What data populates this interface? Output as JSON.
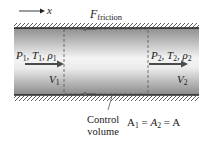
{
  "diagram": {
    "x_axis": {
      "label": "x"
    },
    "friction": {
      "symbol": "F",
      "subscript": "friction"
    },
    "inlet": {
      "P": "P",
      "P_sub": "1",
      "T": "T",
      "T_sub": "1",
      "rho": "ρ",
      "rho_sub": "1",
      "V": "V",
      "V_sub": "1",
      "sep": ", "
    },
    "outlet": {
      "P": "P",
      "P_sub": "2",
      "T": "T",
      "T_sub": "2",
      "rho": "ρ",
      "rho_sub": "2",
      "V": "V",
      "V_sub": "2",
      "sep": ", "
    },
    "control_volume": {
      "line1": "Control",
      "line2": "volume"
    },
    "area_relation": {
      "A1": "A",
      "A1_sub": "1",
      "eq1": " = ",
      "A2": "A",
      "A2_sub": "2",
      "eq2": " = ",
      "A": "A"
    },
    "colors": {
      "pipe_edge": "#9a9a9a",
      "pipe_center": "#f2f2f2",
      "wall": "#222222",
      "arrow": "#555555"
    }
  }
}
